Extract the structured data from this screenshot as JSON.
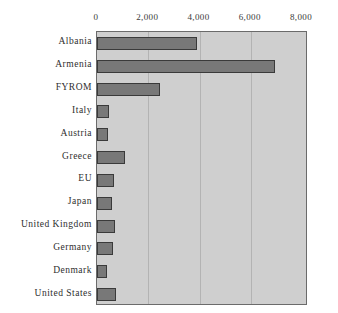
{
  "chart_data": {
    "type": "bar",
    "orientation": "horizontal",
    "title": "",
    "subtitle": "",
    "xlabel": "",
    "ylabel": "",
    "categories": [
      "Albania",
      "Armenia",
      "FYROM",
      "Italy",
      "Austria",
      "Greece",
      "EU",
      "Japan",
      "United Kingdom",
      "Germany",
      "Denmark",
      "United States"
    ],
    "values": [
      3890,
      6930,
      2470,
      480,
      420,
      1100,
      650,
      590,
      710,
      630,
      400,
      750
    ],
    "series": [
      {
        "name": "value",
        "values": [
          3890,
          6930,
          2470,
          480,
          420,
          1100,
          650,
          590,
          710,
          630,
          400,
          750
        ]
      }
    ],
    "xlim": [
      0,
      8000
    ],
    "x_ticks": [
      0,
      2000,
      4000,
      6000,
      8000
    ],
    "x_tick_labels": [
      "0",
      "2,000",
      "4,000",
      "6,000",
      "8,000"
    ],
    "x_axis_position": "top",
    "grid": true,
    "grid_axis": "x",
    "legend": false,
    "legend_position": "none",
    "plot_background_color": "#cfcfcf",
    "bar_fill_color": "#787878",
    "bar_edge_color": "#3a3a3a",
    "gridline_color": "#b3b3b3",
    "axis_border_color": "#6b6b6b",
    "text_color": "#2e2e2e"
  }
}
